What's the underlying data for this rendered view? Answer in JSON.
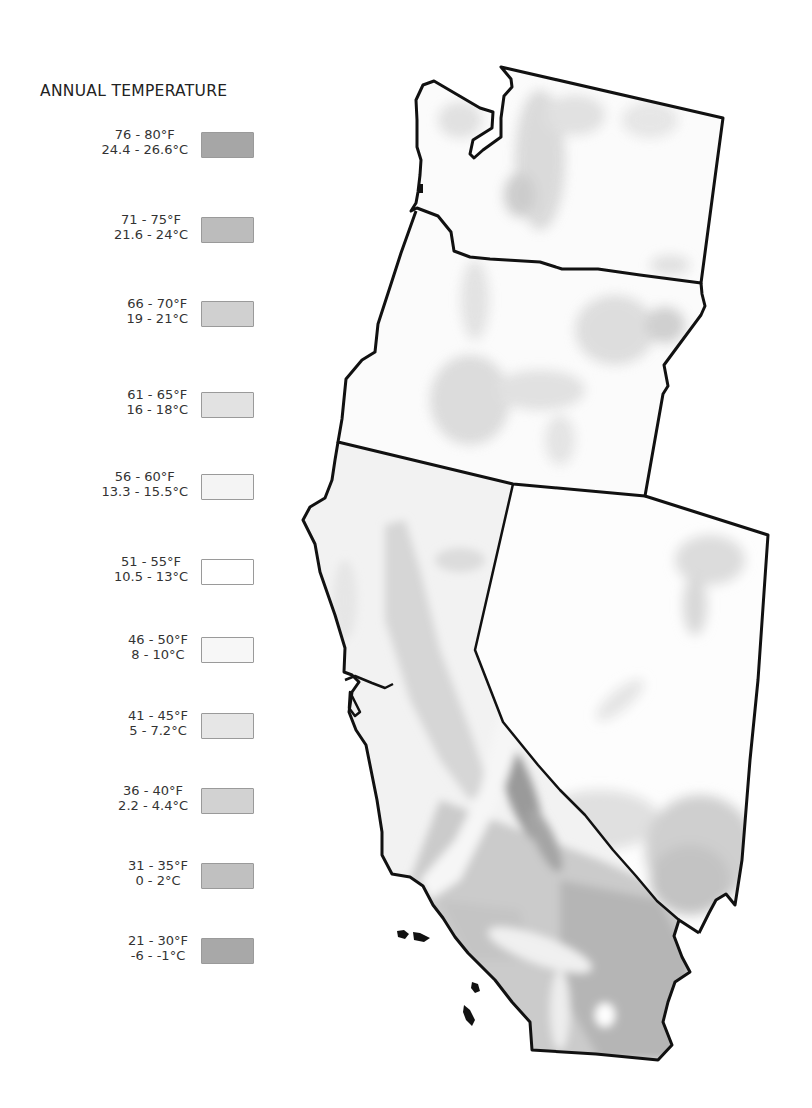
{
  "legend": {
    "title": "ANNUAL TEMPERATURE",
    "items": [
      {
        "fahrenheit": "76 - 80°F",
        "celsius": "24.4 - 26.6°C",
        "color": "#a6a6a6"
      },
      {
        "fahrenheit": "71 - 75°F",
        "celsius": "21.6 - 24°C",
        "color": "#bcbcbc"
      },
      {
        "fahrenheit": "66 - 70°F",
        "celsius": "19 - 21°C",
        "color": "#d0d0d0"
      },
      {
        "fahrenheit": "61 - 65°F",
        "celsius": "16 - 18°C",
        "color": "#e2e2e2"
      },
      {
        "fahrenheit": "56 - 60°F",
        "celsius": "13.3 - 15.5°C",
        "color": "#f4f4f4"
      },
      {
        "fahrenheit": "51 - 55°F",
        "celsius": "10.5 - 13°C",
        "color": "#ffffff"
      },
      {
        "fahrenheit": "46 - 50°F",
        "celsius": "8 - 10°C",
        "color": "#f7f7f7"
      },
      {
        "fahrenheit": "41 - 45°F",
        "celsius": "5 - 7.2°C",
        "color": "#e6e6e6"
      },
      {
        "fahrenheit": "36 - 40°F",
        "celsius": "2.2 - 4.4°C",
        "color": "#d2d2d2"
      },
      {
        "fahrenheit": "31 - 35°F",
        "celsius": "0 - 2°C",
        "color": "#c0c0c0"
      },
      {
        "fahrenheit": "21 - 30°F",
        "celsius": "-6 - -1°C",
        "color": "#a8a8a8"
      }
    ]
  },
  "map": {
    "regions": [
      "Washington",
      "Oregon",
      "California",
      "Nevada"
    ],
    "outline_color": "#111111"
  }
}
